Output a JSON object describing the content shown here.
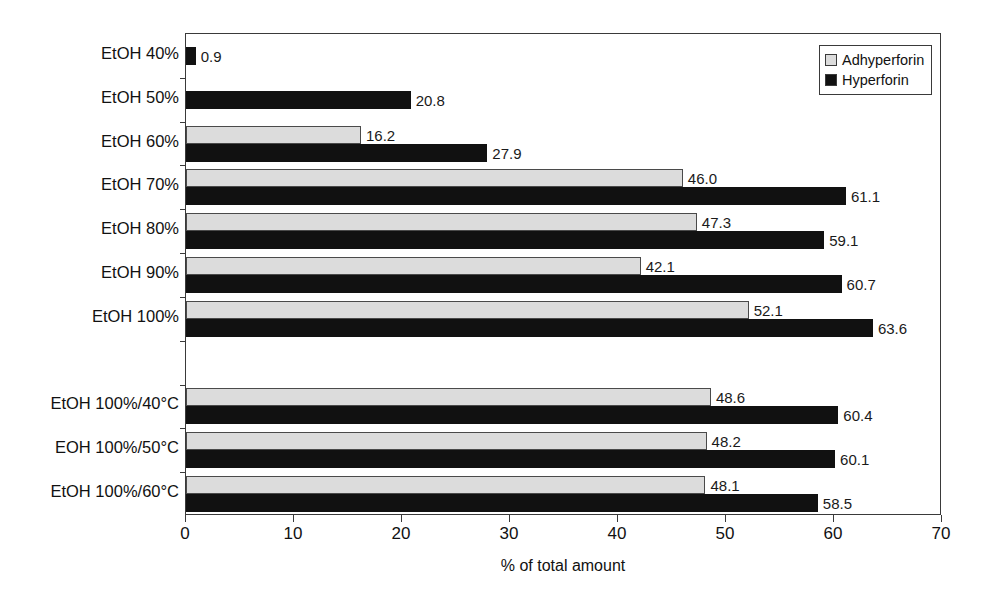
{
  "chart_data": {
    "type": "bar",
    "orientation": "horizontal",
    "title": "",
    "xlabel": "% of total amount",
    "ylabel": "",
    "xlim": [
      0,
      70
    ],
    "xticks": [
      0,
      10,
      20,
      30,
      40,
      50,
      60,
      70
    ],
    "xtick_labels": [
      "0",
      "10",
      "20",
      "30",
      "40",
      "50",
      "60",
      "70"
    ],
    "grid": false,
    "legend_position": "top-right",
    "categories": [
      "EtOH 40%",
      "EtOH 50%",
      "EtOH 60%",
      "EtOH 70%",
      "EtOH 80%",
      "EtOH 90%",
      "EtOH 100%",
      "",
      "EtOH 100%/40°C",
      "EOH 100%/50°C",
      "EtOH 100%/60°C"
    ],
    "series": [
      {
        "name": "Adhyperforin",
        "color": "#dcdcdc",
        "values": [
          null,
          null,
          16.2,
          46.0,
          47.3,
          42.1,
          52.1,
          null,
          48.6,
          48.2,
          48.1
        ],
        "labels": [
          "",
          "",
          "16.2",
          "46.0",
          "47.3",
          "42.1",
          "52.1",
          "",
          "48.6",
          "48.2",
          "48.1"
        ]
      },
      {
        "name": "Hyperforin",
        "color": "#111111",
        "values": [
          0.9,
          20.8,
          27.9,
          61.1,
          59.1,
          60.7,
          63.6,
          null,
          60.4,
          60.1,
          58.5
        ],
        "labels": [
          "0.9",
          "20.8",
          "27.9",
          "61.1",
          "59.1",
          "60.7",
          "63.6",
          "",
          "60.4",
          "60.1",
          "58.5"
        ]
      }
    ]
  },
  "legend": {
    "items": [
      {
        "label": "Adhyperforin",
        "swatch": "light"
      },
      {
        "label": "Hyperforin",
        "swatch": "dark"
      }
    ]
  }
}
